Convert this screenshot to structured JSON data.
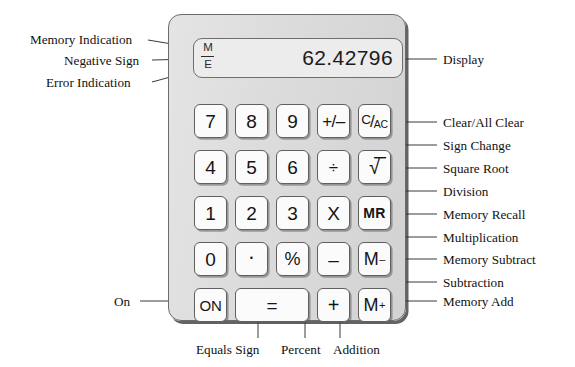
{
  "diagram": {
    "body_color": "#dcdcdc",
    "key_color": "#fbfbfb",
    "outline_color": "#5f5f5f"
  },
  "display": {
    "value": "62.42796",
    "indicator_memory": "M",
    "indicator_error": "E",
    "indicator_negative": "–"
  },
  "keys": {
    "seven": "7",
    "eight": "8",
    "nine": "9",
    "sign_change": "+/–",
    "clear_c": "C",
    "clear_slash": "/",
    "clear_ac": "AC",
    "four": "4",
    "five": "5",
    "six": "6",
    "divide": "÷",
    "square_root": "√̅̅",
    "one": "1",
    "two": "2",
    "three": "3",
    "multiply": "X",
    "memory_recall": "MR",
    "zero": "0",
    "decimal": "·",
    "percent": "%",
    "subtract": "–",
    "memory_subtract_base": "M",
    "memory_subtract_sup": "–",
    "on": "ON",
    "equals": "=",
    "add": "+",
    "memory_add_base": "M",
    "memory_add_sup": "+"
  },
  "labels": {
    "left": [
      {
        "id": "memory-indication",
        "text": "Memory Indication"
      },
      {
        "id": "negative-sign",
        "text": "Negative Sign"
      },
      {
        "id": "error-indication",
        "text": "Error Indication"
      },
      {
        "id": "on",
        "text": "On"
      }
    ],
    "right": [
      {
        "id": "display",
        "text": "Display"
      },
      {
        "id": "clear-all-clear",
        "text": "Clear/All Clear"
      },
      {
        "id": "sign-change",
        "text": "Sign Change"
      },
      {
        "id": "square-root",
        "text": "Square Root"
      },
      {
        "id": "division",
        "text": "Division"
      },
      {
        "id": "memory-recall",
        "text": "Memory Recall"
      },
      {
        "id": "multiplication",
        "text": "Multiplication"
      },
      {
        "id": "memory-subtract",
        "text": "Memory Subtract"
      },
      {
        "id": "subtraction",
        "text": "Subtraction"
      },
      {
        "id": "memory-add",
        "text": "Memory Add"
      }
    ],
    "bottom": [
      {
        "id": "equals-sign",
        "text": "Equals Sign"
      },
      {
        "id": "percent",
        "text": "Percent"
      },
      {
        "id": "addition",
        "text": "Addition"
      }
    ]
  }
}
